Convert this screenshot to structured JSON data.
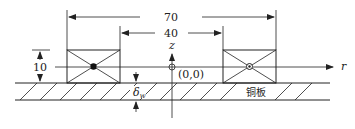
{
  "diagram": {
    "dimensions": {
      "outer_width": "70",
      "inner_gap": "40",
      "coil_height": "10",
      "plate_thickness_symbol": "δ",
      "plate_thickness_subscript": "w"
    },
    "axes": {
      "vertical": "z",
      "horizontal": "r",
      "origin_label": "(0,0)"
    },
    "labels": {
      "plate": "铜板"
    },
    "colors": {
      "stroke": "#222222",
      "background": "#ffffff"
    }
  }
}
